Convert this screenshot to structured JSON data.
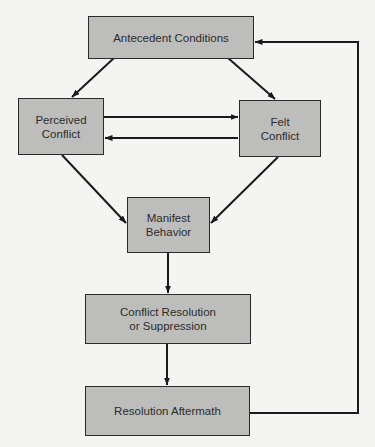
{
  "diagram": {
    "type": "flowchart",
    "colors": {
      "node_fill": "#bdbdbb",
      "edge": "#1a1a1a",
      "background": "#f4f4f2"
    },
    "nodes": {
      "antecedent": {
        "label": "Antecedent Conditions"
      },
      "perceived": {
        "label": "Perceived\nConflict"
      },
      "felt": {
        "label": "Felt\nConflict"
      },
      "manifest": {
        "label": "Manifest\nBehavior"
      },
      "resolution": {
        "label": "Conflict Resolution\nor Suppression"
      },
      "aftermath": {
        "label": "Resolution Aftermath"
      }
    },
    "edges": [
      {
        "from": "Antecedent Conditions",
        "to": "Perceived Conflict"
      },
      {
        "from": "Antecedent Conditions",
        "to": "Felt Conflict"
      },
      {
        "from": "Perceived Conflict",
        "to": "Felt Conflict"
      },
      {
        "from": "Felt Conflict",
        "to": "Perceived Conflict"
      },
      {
        "from": "Perceived Conflict",
        "to": "Manifest Behavior"
      },
      {
        "from": "Felt Conflict",
        "to": "Manifest Behavior"
      },
      {
        "from": "Manifest Behavior",
        "to": "Conflict Resolution or Suppression"
      },
      {
        "from": "Conflict Resolution or Suppression",
        "to": "Resolution Aftermath"
      },
      {
        "from": "Resolution Aftermath",
        "to": "Antecedent Conditions"
      }
    ]
  }
}
